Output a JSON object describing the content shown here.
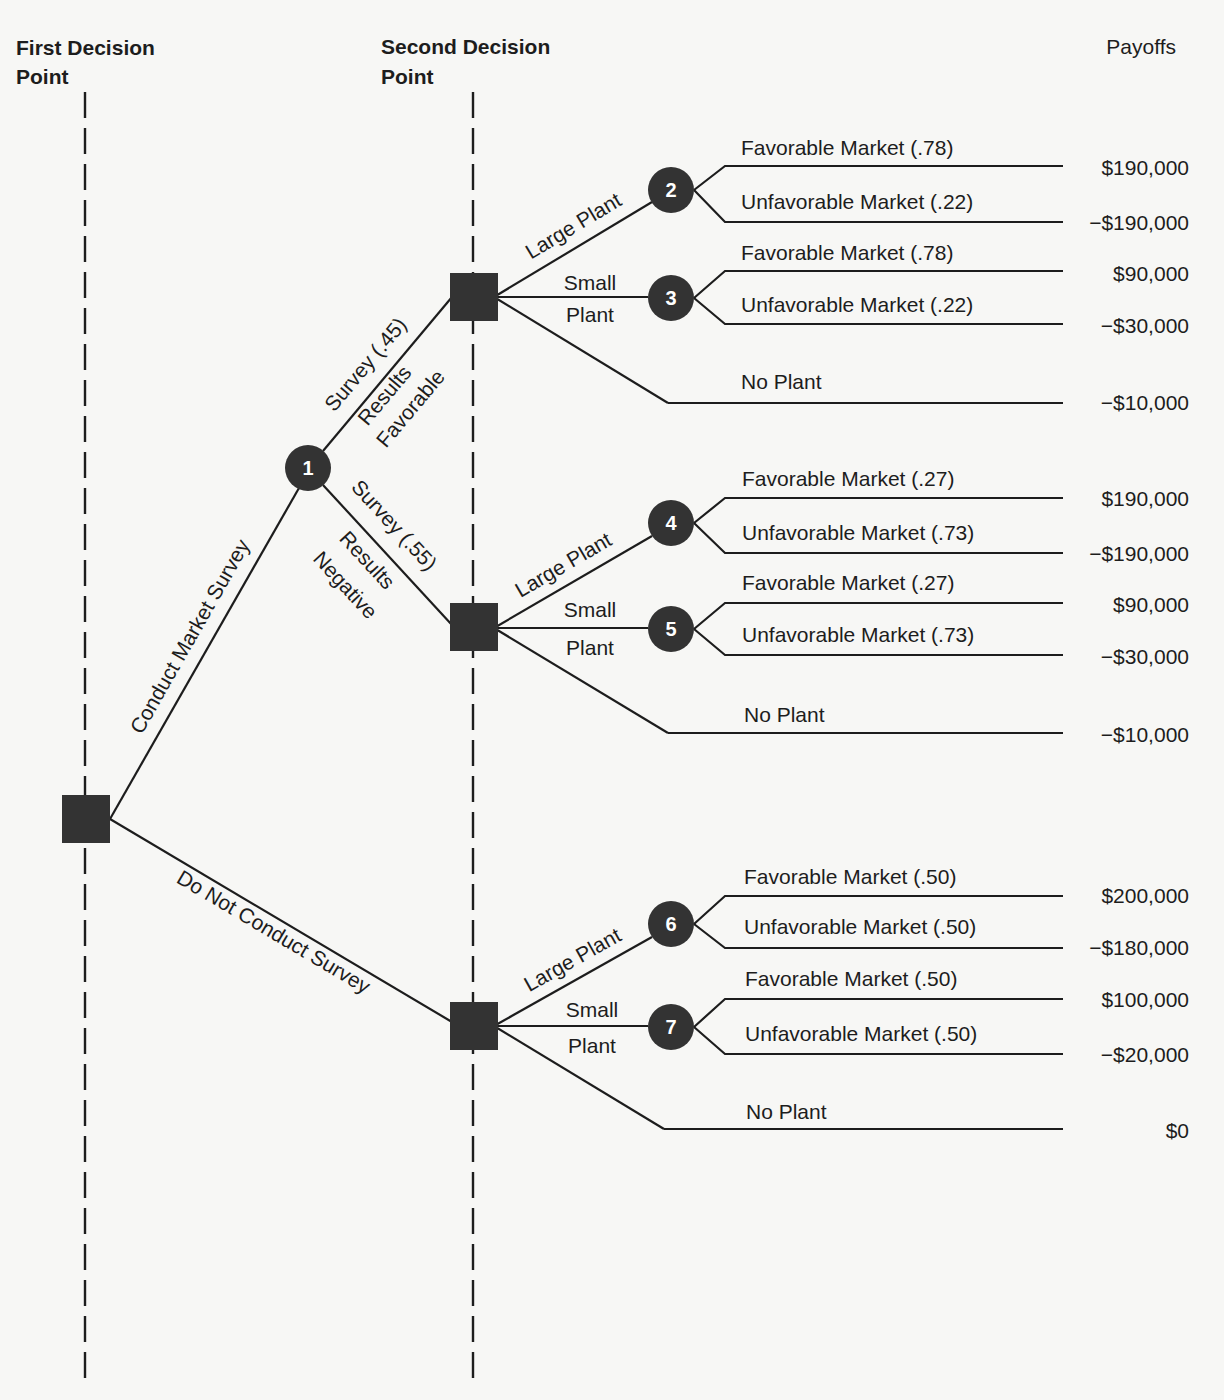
{
  "headers": {
    "first_decision_line1": "First Decision",
    "first_decision_line2": "Point",
    "second_decision_line1": "Second Decision",
    "second_decision_line2": "Point",
    "payoffs": "Payoffs"
  },
  "guides": [
    {
      "x": 85,
      "y1": 92,
      "y2": 1380
    },
    {
      "x": 473,
      "y1": 92,
      "y2": 1380
    }
  ],
  "decision_nodes": [
    {
      "id": "root",
      "x": 62,
      "y": 795,
      "size": 48
    },
    {
      "id": "d-fav",
      "x": 450,
      "y": 273,
      "size": 48
    },
    {
      "id": "d-neg",
      "x": 450,
      "y": 603,
      "size": 48
    },
    {
      "id": "d-nosurvey",
      "x": 450,
      "y": 1002,
      "size": 48
    }
  ],
  "chance_nodes": [
    {
      "label": "1",
      "x": 308,
      "y": 468,
      "r": 23
    },
    {
      "label": "2",
      "x": 671,
      "y": 190,
      "r": 23
    },
    {
      "label": "3",
      "x": 671,
      "y": 298,
      "r": 23
    },
    {
      "label": "4",
      "x": 671,
      "y": 523,
      "r": 23
    },
    {
      "label": "5",
      "x": 671,
      "y": 629,
      "r": 23
    },
    {
      "label": "6",
      "x": 671,
      "y": 924,
      "r": 23
    },
    {
      "label": "7",
      "x": 671,
      "y": 1027,
      "r": 23
    }
  ],
  "edges": [
    {
      "x1": 110,
      "y1": 819,
      "x2": 299,
      "y2": 488
    },
    {
      "x1": 110,
      "y1": 819,
      "x2": 452,
      "y2": 1022
    },
    {
      "x1": 323,
      "y1": 451,
      "x2": 452,
      "y2": 297
    },
    {
      "x1": 323,
      "y1": 485,
      "x2": 452,
      "y2": 625
    },
    {
      "x1": 494,
      "y1": 297,
      "x2": 652,
      "y2": 202
    },
    {
      "x1": 494,
      "y1": 297,
      "x2": 648,
      "y2": 297
    },
    {
      "x1": 494,
      "y1": 297,
      "x2": 668,
      "y2": 403
    },
    {
      "x1": 494,
      "y1": 628,
      "x2": 652,
      "y2": 536
    },
    {
      "x1": 494,
      "y1": 628,
      "x2": 648,
      "y2": 628
    },
    {
      "x1": 494,
      "y1": 628,
      "x2": 668,
      "y2": 733
    },
    {
      "x1": 494,
      "y1": 1026,
      "x2": 652,
      "y2": 937
    },
    {
      "x1": 494,
      "y1": 1026,
      "x2": 648,
      "y2": 1026
    },
    {
      "x1": 494,
      "y1": 1026,
      "x2": 664,
      "y2": 1129
    }
  ],
  "outcome_branches": [
    {
      "from_x": 694,
      "from_y": 190,
      "x_start": 725,
      "y": 166,
      "x_end": 1063,
      "label": "Favorable Market (.78)",
      "label_x": 741,
      "label_y": 155,
      "payoff": "$190,000",
      "payoff_y": 175
    },
    {
      "from_x": 694,
      "from_y": 190,
      "x_start": 725,
      "y": 222,
      "x_end": 1063,
      "label": "Unfavorable Market (.22)",
      "label_x": 741,
      "label_y": 209,
      "payoff": "−$190,000",
      "payoff_y": 230
    },
    {
      "from_x": 694,
      "from_y": 298,
      "x_start": 725,
      "y": 271,
      "x_end": 1063,
      "label": "Favorable Market (.78)",
      "label_x": 741,
      "label_y": 260,
      "payoff": "$90,000",
      "payoff_y": 281
    },
    {
      "from_x": 694,
      "from_y": 298,
      "x_start": 725,
      "y": 324,
      "x_end": 1063,
      "label": "Unfavorable Market (.22)",
      "label_x": 741,
      "label_y": 312,
      "payoff": "−$30,000",
      "payoff_y": 333
    },
    {
      "from_x": null,
      "from_y": null,
      "x_start": 668,
      "y": 403,
      "x_end": 1063,
      "label": "No Plant",
      "label_x": 741,
      "label_y": 389,
      "payoff": "−$10,000",
      "payoff_y": 410
    },
    {
      "from_x": 694,
      "from_y": 523,
      "x_start": 725,
      "y": 498,
      "x_end": 1063,
      "label": "Favorable Market (.27)",
      "label_x": 742,
      "label_y": 486,
      "payoff": "$190,000",
      "payoff_y": 506
    },
    {
      "from_x": 694,
      "from_y": 523,
      "x_start": 725,
      "y": 553,
      "x_end": 1063,
      "label": "Unfavorable Market (.73)",
      "label_x": 742,
      "label_y": 540,
      "payoff": "−$190,000",
      "payoff_y": 561
    },
    {
      "from_x": 694,
      "from_y": 629,
      "x_start": 725,
      "y": 603,
      "x_end": 1063,
      "label": "Favorable Market (.27)",
      "label_x": 742,
      "label_y": 590,
      "payoff": "$90,000",
      "payoff_y": 612
    },
    {
      "from_x": 694,
      "from_y": 629,
      "x_start": 725,
      "y": 655,
      "x_end": 1063,
      "label": "Unfavorable Market (.73)",
      "label_x": 742,
      "label_y": 642,
      "payoff": "−$30,000",
      "payoff_y": 664
    },
    {
      "from_x": null,
      "from_y": null,
      "x_start": 668,
      "y": 733,
      "x_end": 1063,
      "label": "No Plant",
      "label_x": 744,
      "label_y": 722,
      "payoff": "−$10,000",
      "payoff_y": 742
    },
    {
      "from_x": 694,
      "from_y": 924,
      "x_start": 725,
      "y": 896,
      "x_end": 1063,
      "label": "Favorable Market (.50)",
      "label_x": 744,
      "label_y": 884,
      "payoff": "$200,000",
      "payoff_y": 903
    },
    {
      "from_x": 694,
      "from_y": 924,
      "x_start": 725,
      "y": 948,
      "x_end": 1063,
      "label": "Unfavorable Market (.50)",
      "label_x": 744,
      "label_y": 934,
      "payoff": "−$180,000",
      "payoff_y": 955
    },
    {
      "from_x": 694,
      "from_y": 1027,
      "x_start": 725,
      "y": 999,
      "x_end": 1063,
      "label": "Favorable Market (.50)",
      "label_x": 745,
      "label_y": 986,
      "payoff": "$100,000",
      "payoff_y": 1007
    },
    {
      "from_x": 694,
      "from_y": 1027,
      "x_start": 725,
      "y": 1054,
      "x_end": 1063,
      "label": "Unfavorable Market (.50)",
      "label_x": 745,
      "label_y": 1041,
      "payoff": "−$20,000",
      "payoff_y": 1062
    },
    {
      "from_x": null,
      "from_y": null,
      "x_start": 664,
      "y": 1129,
      "x_end": 1063,
      "label": "No Plant",
      "label_x": 746,
      "label_y": 1119,
      "payoff": "$0",
      "payoff_y": 1138
    }
  ],
  "rotated_labels": [
    {
      "text": "Conduct Market Survey",
      "x": 196,
      "y": 640,
      "angle": -60.3
    },
    {
      "text": "Do Not Conduct Survey",
      "x": 270,
      "y": 938,
      "angle": 30.7
    },
    {
      "text": "Survey (.45)",
      "x": 371,
      "y": 369,
      "angle": -50.0
    },
    {
      "text": "Results",
      "x": 390,
      "y": 400,
      "angle": -50.0
    },
    {
      "text": "Favorable",
      "x": 416,
      "y": 413,
      "angle": -50.0
    },
    {
      "text": "Survey (.55)",
      "x": 389,
      "y": 530,
      "angle": 47.3
    },
    {
      "text": "Results",
      "x": 362,
      "y": 565,
      "angle": 47.3
    },
    {
      "text": "Negative",
      "x": 340,
      "y": 590,
      "angle": 47.3
    },
    {
      "text": "Large Plant",
      "x": 577,
      "y": 232,
      "angle": -31.0
    },
    {
      "text": "Large Plant",
      "x": 567,
      "y": 571,
      "angle": -30.2
    },
    {
      "text": "Large Plant",
      "x": 576,
      "y": 966,
      "angle": -29.4
    }
  ],
  "small_plant_labels": [
    {
      "line1": "Small",
      "line2": "Plant",
      "x": 590,
      "y1": 290,
      "y2": 322
    },
    {
      "line1": "Small",
      "line2": "Plant",
      "x": 590,
      "y1": 617,
      "y2": 655
    },
    {
      "line1": "Small",
      "line2": "Plant",
      "x": 592,
      "y1": 1017,
      "y2": 1053
    }
  ],
  "chart_data": {
    "type": "decision_tree",
    "title": "",
    "columns": [
      "First Decision Point",
      "Second Decision Point",
      "Payoffs"
    ],
    "root": {
      "type": "decision",
      "branches": [
        {
          "label": "Conduct Market Survey",
          "node": {
            "type": "chance",
            "id": 1,
            "branches": [
              {
                "label": "Survey Results Favorable",
                "probability": 0.45,
                "node": {
                  "type": "decision",
                  "branches": [
                    {
                      "label": "Large Plant",
                      "node": {
                        "type": "chance",
                        "id": 2,
                        "branches": [
                          {
                            "label": "Favorable Market",
                            "probability": 0.78,
                            "payoff": 190000
                          },
                          {
                            "label": "Unfavorable Market",
                            "probability": 0.22,
                            "payoff": -190000
                          }
                        ]
                      }
                    },
                    {
                      "label": "Small Plant",
                      "node": {
                        "type": "chance",
                        "id": 3,
                        "branches": [
                          {
                            "label": "Favorable Market",
                            "probability": 0.78,
                            "payoff": 90000
                          },
                          {
                            "label": "Unfavorable Market",
                            "probability": 0.22,
                            "payoff": -30000
                          }
                        ]
                      }
                    },
                    {
                      "label": "No Plant",
                      "payoff": -10000
                    }
                  ]
                }
              },
              {
                "label": "Survey Results Negative",
                "probability": 0.55,
                "node": {
                  "type": "decision",
                  "branches": [
                    {
                      "label": "Large Plant",
                      "node": {
                        "type": "chance",
                        "id": 4,
                        "branches": [
                          {
                            "label": "Favorable Market",
                            "probability": 0.27,
                            "payoff": 190000
                          },
                          {
                            "label": "Unfavorable Market",
                            "probability": 0.73,
                            "payoff": -190000
                          }
                        ]
                      }
                    },
                    {
                      "label": "Small Plant",
                      "node": {
                        "type": "chance",
                        "id": 5,
                        "branches": [
                          {
                            "label": "Favorable Market",
                            "probability": 0.27,
                            "payoff": 90000
                          },
                          {
                            "label": "Unfavorable Market",
                            "probability": 0.73,
                            "payoff": -30000
                          }
                        ]
                      }
                    },
                    {
                      "label": "No Plant",
                      "payoff": -10000
                    }
                  ]
                }
              }
            ]
          }
        },
        {
          "label": "Do Not Conduct Survey",
          "node": {
            "type": "decision",
            "branches": [
              {
                "label": "Large Plant",
                "node": {
                  "type": "chance",
                  "id": 6,
                  "branches": [
                    {
                      "label": "Favorable Market",
                      "probability": 0.5,
                      "payoff": 200000
                    },
                    {
                      "label": "Unfavorable Market",
                      "probability": 0.5,
                      "payoff": -180000
                    }
                  ]
                }
              },
              {
                "label": "Small Plant",
                "node": {
                  "type": "chance",
                  "id": 7,
                  "branches": [
                    {
                      "label": "Favorable Market",
                      "probability": 0.5,
                      "payoff": 100000
                    },
                    {
                      "label": "Unfavorable Market",
                      "probability": 0.5,
                      "payoff": -20000
                    }
                  ]
                }
              },
              {
                "label": "No Plant",
                "payoff": 0
              }
            ]
          }
        }
      ]
    }
  }
}
